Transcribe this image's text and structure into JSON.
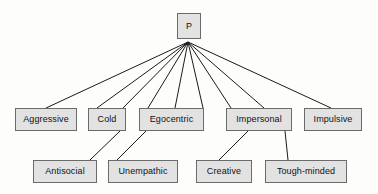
{
  "diagram": {
    "background_color": "#fdfdfc",
    "box_fill_color": "#e2e2e2",
    "box_border_color": "#6b6b6b",
    "text_color": "#111111",
    "edge_color": "#1a1a1a",
    "root": {
      "label": "P",
      "x": 177,
      "y": 13,
      "w": 24,
      "h": 26
    },
    "level2": [
      {
        "label": "Aggressive",
        "x": 15,
        "y": 108,
        "w": 62,
        "h": 23
      },
      {
        "label": "Cold",
        "x": 88,
        "y": 108,
        "w": 38,
        "h": 23
      },
      {
        "label": "Egocentric",
        "x": 139,
        "y": 108,
        "w": 65,
        "h": 23
      },
      {
        "label": "Impersonal",
        "x": 226,
        "y": 108,
        "w": 66,
        "h": 23
      },
      {
        "label": "Impulsive",
        "x": 304,
        "y": 108,
        "w": 58,
        "h": 23
      }
    ],
    "level3": [
      {
        "label": "Antisocial",
        "x": 33,
        "y": 160,
        "w": 64,
        "h": 23
      },
      {
        "label": "Unempathic",
        "x": 108,
        "y": 160,
        "w": 70,
        "h": 23
      },
      {
        "label": "Creative",
        "x": 196,
        "y": 160,
        "w": 56,
        "h": 23
      },
      {
        "label": "Tough-minded",
        "x": 265,
        "y": 160,
        "w": 82,
        "h": 23
      }
    ],
    "edges_from_root": [
      {
        "from_x": 188,
        "from_y": 42,
        "to_x": 46,
        "to_y": 108
      },
      {
        "from_x": 188,
        "from_y": 42,
        "to_x": 97,
        "to_y": 108
      },
      {
        "from_x": 188,
        "from_y": 42,
        "to_x": 123,
        "to_y": 108
      },
      {
        "from_x": 188,
        "from_y": 42,
        "to_x": 148,
        "to_y": 108
      },
      {
        "from_x": 188,
        "from_y": 42,
        "to_x": 175,
        "to_y": 108
      },
      {
        "from_x": 188,
        "from_y": 42,
        "to_x": 203,
        "to_y": 108
      },
      {
        "from_x": 188,
        "from_y": 42,
        "to_x": 231,
        "to_y": 108
      },
      {
        "from_x": 188,
        "from_y": 42,
        "to_x": 264,
        "to_y": 108
      },
      {
        "from_x": 188,
        "from_y": 42,
        "to_x": 331,
        "to_y": 108
      }
    ],
    "edges_level2_to_level3": [
      {
        "from_x": 120,
        "from_y": 131,
        "to_x": 90,
        "to_y": 160
      },
      {
        "from_x": 146,
        "from_y": 131,
        "to_x": 117,
        "to_y": 160
      },
      {
        "from_x": 248,
        "from_y": 131,
        "to_x": 219,
        "to_y": 160
      },
      {
        "from_x": 285,
        "from_y": 131,
        "to_x": 288,
        "to_y": 160
      }
    ]
  }
}
